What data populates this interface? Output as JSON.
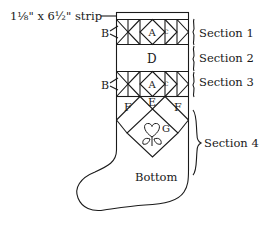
{
  "diagram": {
    "strip_label": "1⅛\" x 6½\" strip",
    "piece_labels": {
      "a_top": "A",
      "c_top": "C",
      "b_top": "B",
      "d": "D",
      "a_bottom": "A",
      "c_bottom": "C",
      "b_bottom": "B",
      "e": "E",
      "f_left": "F",
      "f_right": "F",
      "g": "G",
      "bottom": "Bottom"
    },
    "sections": [
      {
        "label": "Section 1"
      },
      {
        "label": "Section 2"
      },
      {
        "label": "Section 3"
      },
      {
        "label": "Section 4"
      }
    ],
    "icons": [
      "heart-flower-icon"
    ],
    "line_color": "#1a1a1a"
  }
}
